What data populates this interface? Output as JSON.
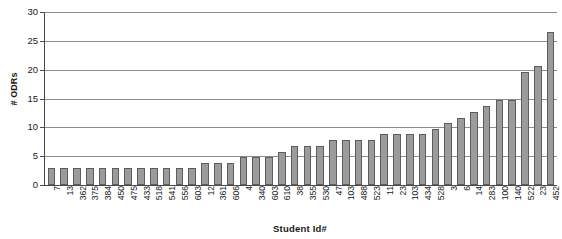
{
  "chart_data": {
    "type": "bar",
    "title": "",
    "xlabel": "Student Id#",
    "ylabel": "# ODRs",
    "ylim": [
      0,
      30
    ],
    "ytick_values": [
      0,
      5,
      10,
      15,
      20,
      25,
      30
    ],
    "ytick_labels": [
      "0",
      "5",
      "10",
      "15",
      "20",
      "25",
      "30"
    ],
    "grid": true,
    "legend": false,
    "categories": [
      "7",
      "13",
      "362",
      "375",
      "384",
      "450",
      "475",
      "433",
      "518",
      "541",
      "556",
      "603",
      "12",
      "361",
      "606",
      "4",
      "340",
      "603",
      "610",
      "38",
      "355",
      "530",
      "47",
      "103",
      "488",
      "523",
      "11",
      "23",
      "103",
      "434",
      "528",
      "3",
      "6",
      "14",
      "283",
      "100",
      "140",
      "522",
      "23",
      "452"
    ],
    "values": [
      3,
      3,
      3,
      3,
      3,
      3,
      3,
      3,
      3,
      3,
      3,
      3,
      3.9,
      3.9,
      3.9,
      4.9,
      4.9,
      4.9,
      5.8,
      6.8,
      6.8,
      6.8,
      7.8,
      7.8,
      7.8,
      7.8,
      8.8,
      8.8,
      8.8,
      8.8,
      9.8,
      10.7,
      11.7,
      12.7,
      13.7,
      14.7,
      14.7,
      19.6,
      20.6,
      26.5
    ],
    "colors": {
      "bar_fill": "#9b9b9b",
      "bar_stroke": "#5d5d5d",
      "gridline": "#8c8c8c",
      "axis": "#4a4a4a",
      "background": "#ffffff",
      "text": "#1a1a1a"
    }
  }
}
